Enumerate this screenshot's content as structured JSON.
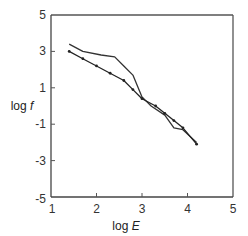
{
  "chart_data": {
    "type": "line",
    "title": "",
    "xlabel": "log E",
    "xlabel_prefix": "log ",
    "xlabel_var": "E",
    "ylabel": "log f",
    "ylabel_prefix": "log ",
    "ylabel_var": "f",
    "xlim": [
      1,
      5
    ],
    "ylim": [
      -5,
      5
    ],
    "xticks": [
      1,
      2,
      3,
      4,
      5
    ],
    "yticks": [
      -5,
      -3,
      -1,
      1,
      3,
      5
    ],
    "xtick_labels": [
      "1",
      "2",
      "3",
      "4",
      "5"
    ],
    "ytick_labels": [
      "-5",
      "-3",
      "-1",
      "1",
      "3",
      "5"
    ],
    "grid": false,
    "legend": "none",
    "series": [
      {
        "name": "upper-solid",
        "style": "solid",
        "color": "#333333",
        "x": [
          1.4,
          1.7,
          2.1,
          2.4,
          2.6,
          2.8,
          3.0,
          3.2,
          3.5,
          3.7,
          3.9,
          4.2
        ],
        "y": [
          3.4,
          3.0,
          2.8,
          2.7,
          2.2,
          1.7,
          0.5,
          0.0,
          -0.5,
          -1.2,
          -1.3,
          -2.0
        ]
      },
      {
        "name": "lower-dotted",
        "style": "solid-with-markers",
        "color": "#222222",
        "x": [
          1.4,
          1.7,
          2.0,
          2.3,
          2.6,
          2.8,
          3.0,
          3.3,
          3.5,
          3.7,
          3.9,
          4.2
        ],
        "y": [
          3.0,
          2.6,
          2.2,
          1.8,
          1.4,
          0.9,
          0.4,
          0.0,
          -0.4,
          -0.8,
          -1.2,
          -2.1
        ]
      }
    ]
  }
}
